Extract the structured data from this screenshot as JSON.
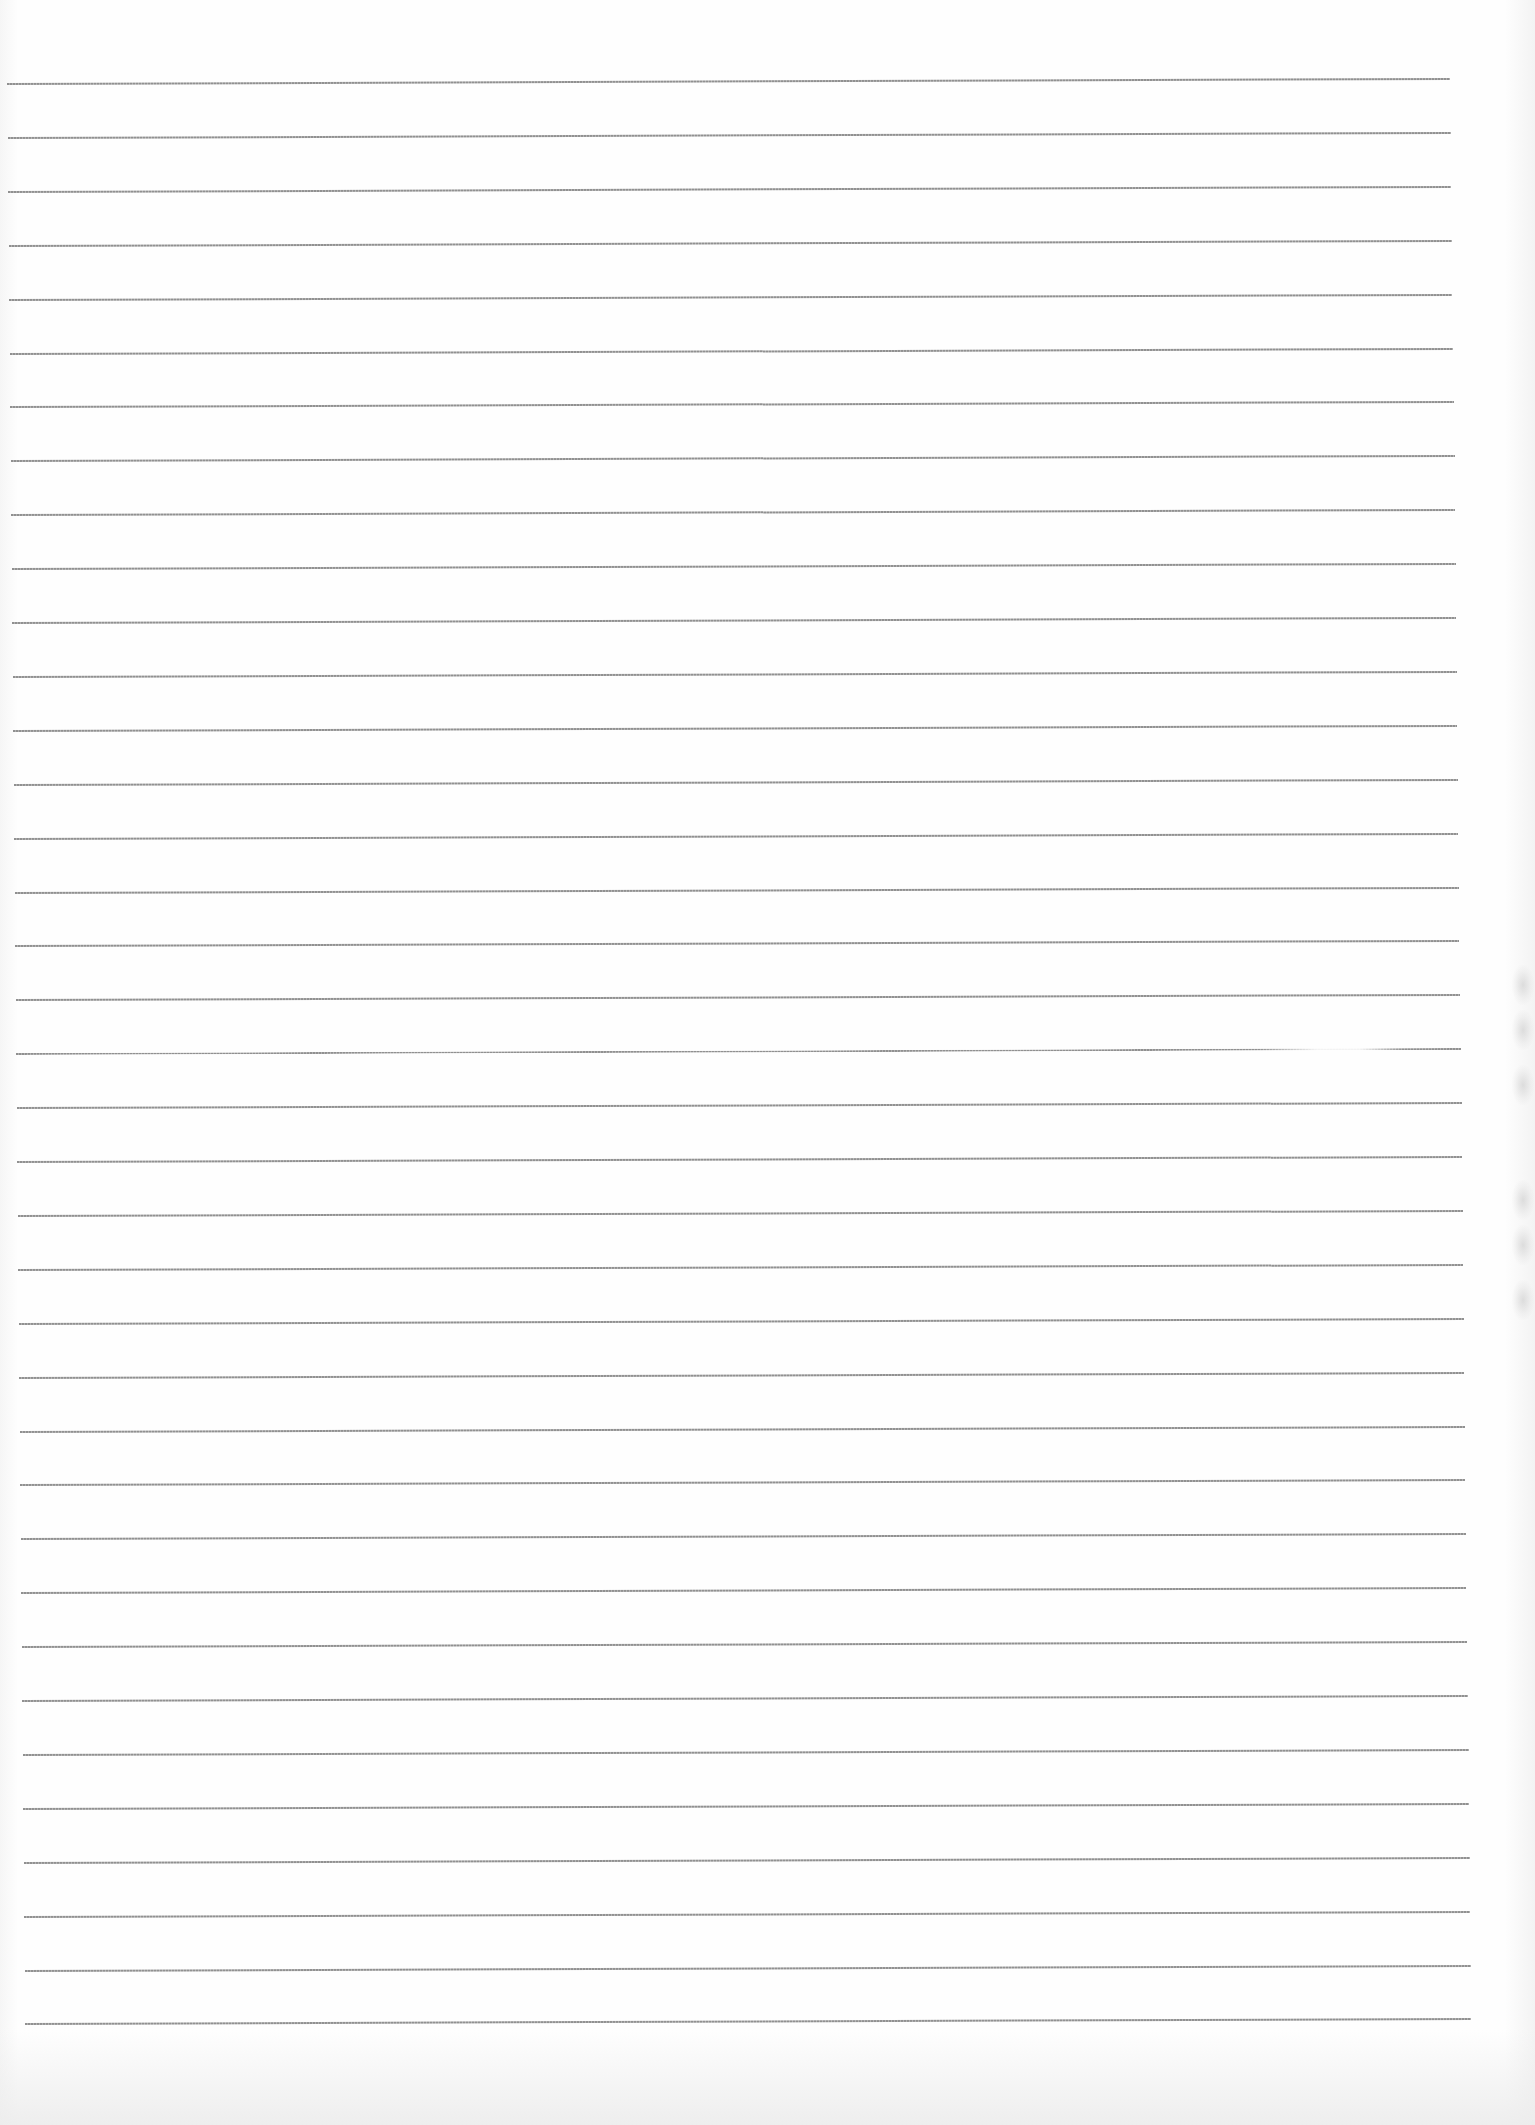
{
  "document": {
    "type": "blank lined paper",
    "background_color": "#fefefe",
    "rule_color": "#8a8a8a",
    "rule_count": 37,
    "first_rule_y": 84,
    "rule_spacing_px": 53.9,
    "rules_left_top_x": 7,
    "rules_right_top_x": 1450,
    "rules_left_bottom_x": 25,
    "rules_right_bottom_x": 1471,
    "handwritten_text": ""
  }
}
